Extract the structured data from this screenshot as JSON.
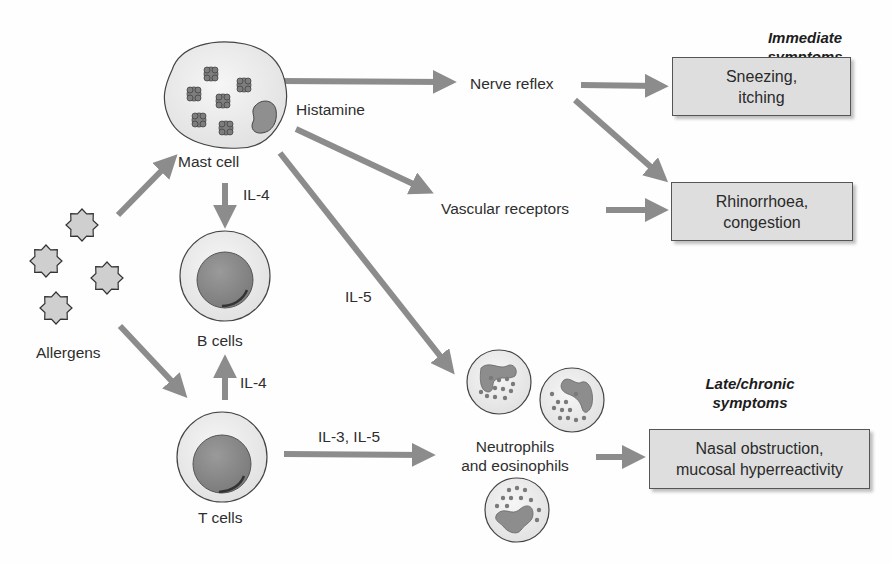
{
  "diagram": {
    "title_headers": {
      "immediate": "Immediate symptoms",
      "late": "Late/chronic symptoms"
    },
    "nodes": {
      "allergens": "Allergens",
      "mast_cell": "Mast cell",
      "b_cells": "B cells",
      "t_cells": "T cells",
      "neutrophils": {
        "line1": "Neutrophils",
        "line2": "and eosinophils"
      },
      "nerve_reflex": "Nerve reflex",
      "vascular_receptors": "Vascular receptors"
    },
    "edge_labels": {
      "histamine": "Histamine",
      "il4_mast_to_b": "IL-4",
      "il4_t_to_b": "IL-4",
      "il5_mast_to_neutro": "IL-5",
      "il3_il5_t_to_neutro": "IL-3, IL-5"
    },
    "symptom_boxes": {
      "sneezing": {
        "line1": "Sneezing,",
        "line2": "itching"
      },
      "rhinorrhoea": {
        "line1": "Rhinorrhoea,",
        "line2": "congestion"
      },
      "nasal_obstruction": {
        "line1": "Nasal obstruction,",
        "line2": "mucosal hyperreactivity"
      }
    },
    "edges": [
      {
        "from": "Allergens",
        "to": "Mast cell"
      },
      {
        "from": "Allergens",
        "to": "T cells"
      },
      {
        "from": "Mast cell",
        "to": "B cells",
        "label": "IL-4"
      },
      {
        "from": "T cells",
        "to": "B cells",
        "label": "IL-4"
      },
      {
        "from": "Mast cell",
        "to": "Nerve reflex",
        "label": "Histamine"
      },
      {
        "from": "Mast cell",
        "to": "Vascular receptors",
        "label": "Histamine"
      },
      {
        "from": "Mast cell",
        "to": "Neutrophils and eosinophils",
        "label": "IL-5"
      },
      {
        "from": "T cells",
        "to": "Neutrophils and eosinophils",
        "label": "IL-3, IL-5"
      },
      {
        "from": "Nerve reflex",
        "to": "Sneezing, itching"
      },
      {
        "from": "Nerve reflex",
        "to": "Rhinorrhoea, congestion"
      },
      {
        "from": "Vascular receptors",
        "to": "Rhinorrhoea, congestion"
      },
      {
        "from": "Neutrophils and eosinophils",
        "to": "Nasal obstruction, mucosal hyperreactivity"
      }
    ],
    "colors": {
      "arrow": "#8c8c8c",
      "box_fill": "#dedede",
      "cell_fill": "#ebebeb",
      "nucleus": "#8a8a8a",
      "allergen_fill": "#cfcfcf"
    }
  }
}
